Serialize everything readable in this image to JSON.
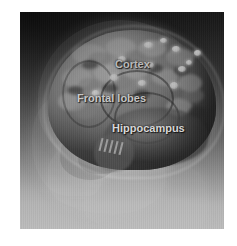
{
  "figure": {
    "type": "anatomical-illustration",
    "style": "grayscale",
    "background_color": "#ffffff",
    "plate": {
      "gradient_top_color": "#1a1a1a",
      "gradient_bottom_color": "#bcbcbc",
      "x": 20,
      "y": 12,
      "width": 204,
      "height": 217
    },
    "label_color": "#ffffff"
  },
  "labels": [
    {
      "id": "cortex",
      "text": "Cortex",
      "x": 95,
      "y": 47
    },
    {
      "id": "frontal-lobes",
      "text": "Frontal lobes",
      "x": 57,
      "y": 81
    },
    {
      "id": "hippocampus",
      "text": "Hippocampus",
      "x": 92,
      "y": 111
    }
  ]
}
